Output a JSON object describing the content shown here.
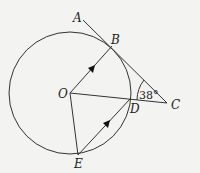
{
  "diagram": {
    "type": "circle-geometry",
    "circle": {
      "center": "O"
    },
    "points": {
      "A": {
        "label": "A"
      },
      "B": {
        "label": "B"
      },
      "C": {
        "label": "C"
      },
      "O": {
        "label": "O"
      },
      "D": {
        "label": "D"
      },
      "E": {
        "label": "E"
      }
    },
    "segments": [
      "AC (tangent at B)",
      "OB",
      "OC",
      "OE",
      "ED"
    ],
    "parallel_marks": [
      "OB",
      "ED"
    ],
    "angle": {
      "at": "C",
      "label": "38°"
    },
    "colors": {
      "stroke": "#333333",
      "background": "#f3f3f1"
    }
  }
}
